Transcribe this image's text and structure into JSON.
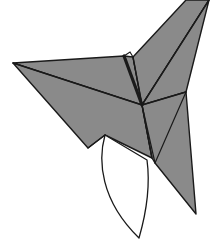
{
  "canvas": {
    "width": 211,
    "height": 241,
    "background": "#ffffff",
    "title": "Origami paper fold figure"
  },
  "watermark": {
    "text": "",
    "color": "#f2f2f2"
  },
  "style": {
    "fill_gray": "#8a8a8a",
    "fill_white": "#ffffff",
    "stroke": "#1a1a1a",
    "stroke_width": 1.4,
    "crease_width": 1.2,
    "heavy_crease_width": 3.2
  },
  "figure": {
    "name": "origami-crane-fold",
    "vertices": {
      "left_tip": [
        13,
        63
      ],
      "center": [
        142,
        105
      ],
      "notch_upper": [
        124,
        56
      ],
      "notch_step": [
        130,
        52
      ],
      "notch_right": [
        133,
        57
      ],
      "top_right_a": [
        196,
        0
      ],
      "top_right_b": [
        209,
        0
      ],
      "top_edge_c": [
        186,
        0
      ],
      "right_mid": [
        186,
        92
      ],
      "right_tail_tip": [
        196,
        214
      ],
      "tail_inner": [
        155,
        163
      ],
      "lower_mid": [
        152,
        158
      ],
      "white_top_left": [
        105,
        135
      ],
      "white_tip": [
        139,
        238
      ],
      "white_right": [
        147,
        160
      ],
      "lower_left_edge": [
        88,
        148
      ]
    },
    "panels": [
      {
        "name": "left-wing-panel",
        "fill": "#8a8a8a",
        "path": "M13,63 L124,56 L133,57 L142,105 Z"
      },
      {
        "name": "left-lower-panel",
        "fill": "#8a8a8a",
        "path": "M13,63 L142,105 L152,158 L105,135 L88,148 Z"
      },
      {
        "name": "upper-right-large-panel",
        "fill": "#8a8a8a",
        "path": "M133,57 L186,0 L209,0 L142,105 Z"
      },
      {
        "name": "upper-right-outer-panel",
        "fill": "#8a8a8a",
        "path": "M209,0 L186,92 L142,105 Z"
      },
      {
        "name": "right-tail-panel",
        "fill": "#8a8a8a",
        "path": "M142,105 L186,92 L196,214 L155,163 L152,158 Z"
      },
      {
        "name": "white-lobe-panel",
        "fill": "#ffffff",
        "path": "M105,135 C98,160 100,200 139,238 C150,200 149,175 147,160 Z"
      }
    ],
    "creases": [
      {
        "name": "crease-left-tip-to-center",
        "weight": "normal",
        "path": "M13,63 L142,105"
      },
      {
        "name": "crease-notch-to-center",
        "weight": "heavy",
        "path": "M124,56 L142,105"
      },
      {
        "name": "crease-notch-right-to-center",
        "weight": "normal",
        "path": "M133,57 L142,105"
      },
      {
        "name": "crease-center-to-topright",
        "weight": "normal",
        "path": "M142,105 L209,0"
      },
      {
        "name": "crease-center-to-rightmid",
        "weight": "normal",
        "path": "M142,105 L186,92"
      },
      {
        "name": "crease-center-to-lowermid",
        "weight": "normal",
        "path": "M142,105 L152,158"
      },
      {
        "name": "crease-center-to-tailinner",
        "weight": "normal",
        "path": "M142,105 L155,163"
      },
      {
        "name": "crease-rightmid-to-tailinner",
        "weight": "normal",
        "path": "M186,92 L155,163"
      },
      {
        "name": "crease-lowerleft-white-edge",
        "weight": "normal",
        "path": "M105,135 L88,148"
      }
    ]
  }
}
